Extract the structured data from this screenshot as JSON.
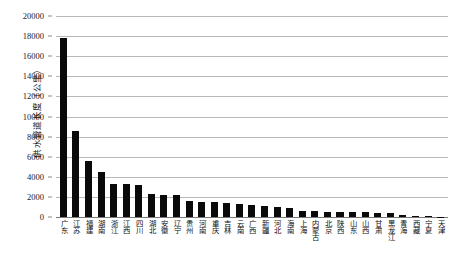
{
  "chart_data": {
    "type": "bar",
    "title": "",
    "xlabel": "",
    "ylabel": "供水管道长度（公里）",
    "ylim": [
      0,
      20000
    ],
    "ytick_step": 2000,
    "yticks": [
      "20000",
      "18000",
      "16000",
      "14000",
      "12000",
      "10000",
      "8000",
      "6000",
      "4000",
      "2000",
      "0"
    ],
    "grid": true,
    "legend": "none",
    "bar_color": "#0a0a0a",
    "categories": [
      "广东",
      "江苏",
      "福建",
      "湖南",
      "浙江",
      "江西",
      "四川",
      "湖北",
      "安徽",
      "辽宁",
      "贵州",
      "河南",
      "重庆",
      "吉林",
      "云南",
      "广西",
      "新疆",
      "河北",
      "海南",
      "上海",
      "内蒙古",
      "北京",
      "陕西",
      "山东",
      "山西",
      "甘肃",
      "黑龙江",
      "青海",
      "西藏",
      "宁夏",
      "天津"
    ],
    "values": [
      17800,
      8600,
      5600,
      4500,
      3300,
      3250,
      3200,
      2300,
      2200,
      2150,
      1550,
      1500,
      1450,
      1350,
      1250,
      1150,
      1050,
      950,
      900,
      620,
      580,
      540,
      520,
      500,
      470,
      420,
      400,
      250,
      110,
      70,
      40
    ]
  }
}
